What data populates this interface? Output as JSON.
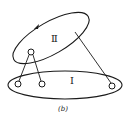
{
  "figure": {
    "caption": "(b)",
    "regions": [
      {
        "id": "region-2",
        "label": "Ⅱ"
      },
      {
        "id": "region-1",
        "label": "Ⅰ"
      }
    ],
    "colors": {
      "stroke": "#1a1a1a",
      "background": "#ffffff"
    }
  }
}
